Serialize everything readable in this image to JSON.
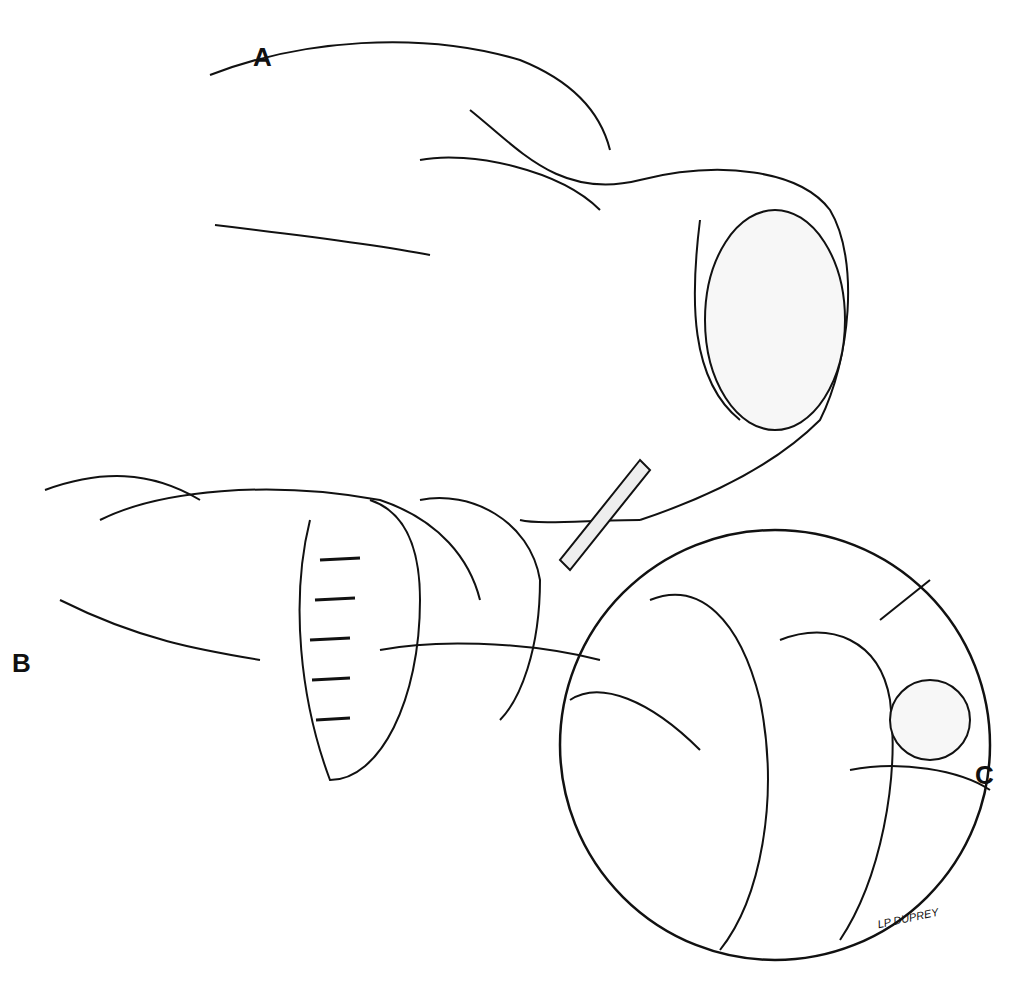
{
  "figure": {
    "panels": [
      {
        "id": "A",
        "label": "A",
        "description": "Hand holding tissue with scalpel incision"
      },
      {
        "id": "B",
        "label": "B",
        "description": "Hands holding incised tissue with interrupted sutures"
      },
      {
        "id": "C",
        "label": "C",
        "description": "Magnified circular inset showing suture placement with instrument"
      }
    ],
    "signature": "LP DUPREY",
    "colors": {
      "ink": "#111111",
      "background": "#ffffff"
    }
  }
}
